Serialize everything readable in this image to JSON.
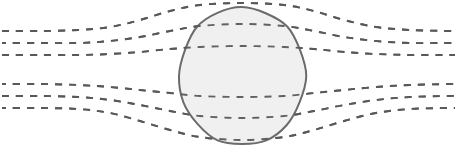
{
  "figure": {
    "name": "field-lines-around-sphere-diagram",
    "width": 457,
    "height": 164,
    "background_color": "#ffffff",
    "text_labels": []
  },
  "style": {
    "line_color": "#595959",
    "line_width": 1.9,
    "dash_pattern": "7 7",
    "sphere_fill": "#f0f0f0",
    "sphere_stroke": "#6b6b6b",
    "sphere_stroke_width": 2.0
  },
  "chart_data": {
    "type": "line",
    "title": "",
    "xlabel": "",
    "ylabel": "",
    "grid": false,
    "legend": null,
    "xlim": [
      0,
      457
    ],
    "ylim": [
      0,
      164
    ],
    "obstacle": {
      "shape": "sphere",
      "center_x": 242,
      "center_y": 76,
      "radius_x": 63,
      "radius_y": 69,
      "fill": "#f0f0f0",
      "stroke": "#6b6b6b"
    },
    "series": [
      {
        "name": "field-line-upper-1",
        "group": "upper",
        "index": 1,
        "style": "dashed",
        "points": [
          [
            2,
            31
          ],
          [
            40,
            31
          ],
          [
            78,
            30
          ],
          [
            110,
            27
          ],
          [
            140,
            20
          ],
          [
            170,
            11
          ],
          [
            200,
            5
          ],
          [
            242,
            3
          ],
          [
            284,
            5
          ],
          [
            314,
            11
          ],
          [
            344,
            20
          ],
          [
            376,
            27
          ],
          [
            410,
            30
          ],
          [
            448,
            31
          ],
          [
            455,
            31
          ]
        ]
      },
      {
        "name": "field-line-upper-2",
        "group": "upper",
        "index": 2,
        "style": "dashed",
        "points": [
          [
            2,
            43
          ],
          [
            40,
            43
          ],
          [
            78,
            43
          ],
          [
            110,
            41
          ],
          [
            140,
            37
          ],
          [
            170,
            31
          ],
          [
            200,
            26
          ],
          [
            242,
            24
          ],
          [
            284,
            26
          ],
          [
            314,
            31
          ],
          [
            344,
            37
          ],
          [
            376,
            41
          ],
          [
            410,
            43
          ],
          [
            448,
            43
          ],
          [
            455,
            43
          ]
        ]
      },
      {
        "name": "field-line-upper-3",
        "group": "upper",
        "index": 3,
        "style": "dashed",
        "points": [
          [
            2,
            55
          ],
          [
            40,
            55
          ],
          [
            78,
            55
          ],
          [
            110,
            54
          ],
          [
            140,
            52
          ],
          [
            170,
            49
          ],
          [
            200,
            47
          ],
          [
            242,
            46
          ],
          [
            284,
            47
          ],
          [
            314,
            49
          ],
          [
            344,
            52
          ],
          [
            376,
            54
          ],
          [
            410,
            55
          ],
          [
            448,
            55
          ],
          [
            455,
            55
          ]
        ]
      },
      {
        "name": "field-line-lower-1",
        "group": "lower",
        "index": 1,
        "style": "dashed",
        "points": [
          [
            2,
            84
          ],
          [
            40,
            84
          ],
          [
            78,
            85
          ],
          [
            110,
            87
          ],
          [
            140,
            90
          ],
          [
            170,
            93
          ],
          [
            200,
            96
          ],
          [
            242,
            97
          ],
          [
            284,
            96
          ],
          [
            314,
            93
          ],
          [
            344,
            90
          ],
          [
            376,
            87
          ],
          [
            410,
            85
          ],
          [
            448,
            84
          ],
          [
            455,
            84
          ]
        ]
      },
      {
        "name": "field-line-lower-2",
        "group": "lower",
        "index": 2,
        "style": "dashed",
        "points": [
          [
            2,
            96
          ],
          [
            40,
            96
          ],
          [
            78,
            97
          ],
          [
            110,
            100
          ],
          [
            140,
            105
          ],
          [
            170,
            111
          ],
          [
            200,
            116
          ],
          [
            242,
            118
          ],
          [
            284,
            116
          ],
          [
            314,
            111
          ],
          [
            344,
            105
          ],
          [
            376,
            100
          ],
          [
            410,
            97
          ],
          [
            448,
            96
          ],
          [
            455,
            96
          ]
        ]
      },
      {
        "name": "field-line-lower-3",
        "group": "lower",
        "index": 3,
        "style": "dashed",
        "points": [
          [
            2,
            108
          ],
          [
            40,
            108
          ],
          [
            78,
            109
          ],
          [
            110,
            113
          ],
          [
            140,
            121
          ],
          [
            170,
            130
          ],
          [
            200,
            137
          ],
          [
            242,
            140
          ],
          [
            284,
            137
          ],
          [
            314,
            130
          ],
          [
            344,
            121
          ],
          [
            376,
            113
          ],
          [
            410,
            109
          ],
          [
            448,
            108
          ],
          [
            455,
            108
          ]
        ]
      }
    ]
  }
}
